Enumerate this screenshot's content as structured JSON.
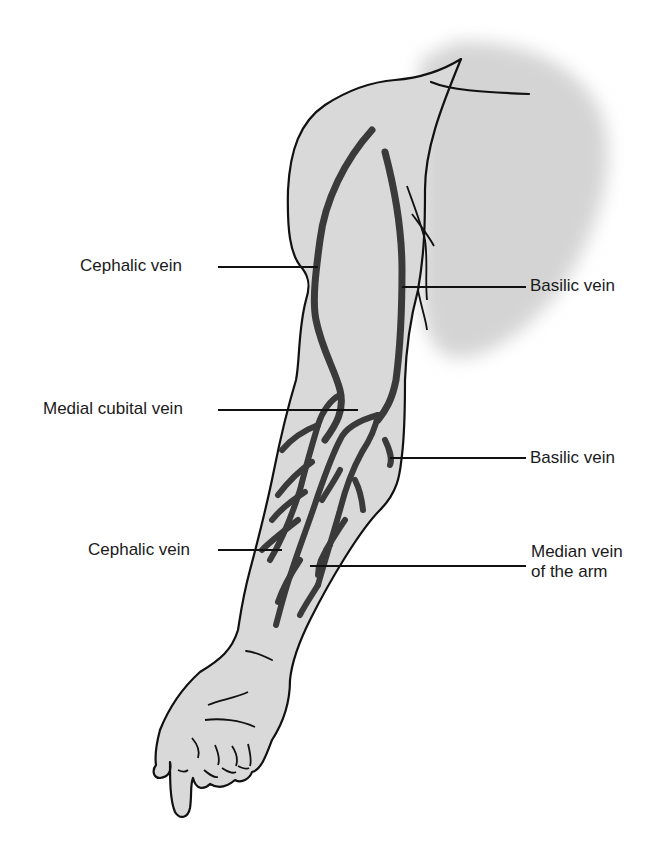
{
  "figure": {
    "colors": {
      "skin_fill": "#d9d9d9",
      "torso_shade": "#d4d4d4",
      "outline": "#111111",
      "vein": "#3a3a3a",
      "leader_line": "#111111",
      "label_text": "#1a1a1a",
      "background": "#ffffff"
    }
  },
  "labels": [
    {
      "id": "cephalic-upper",
      "text": "Cephalic vein",
      "side": "left",
      "x": 80,
      "y": 256
    },
    {
      "id": "basilic-upper",
      "text": "Basilic vein",
      "side": "right",
      "x": 530,
      "y": 276
    },
    {
      "id": "medial-cubital",
      "text": "Medial cubital vein",
      "side": "left",
      "x": 43,
      "y": 399
    },
    {
      "id": "basilic-lower",
      "text": "Basilic vein",
      "side": "right",
      "x": 530,
      "y": 448
    },
    {
      "id": "cephalic-lower",
      "text": "Cephalic vein",
      "side": "left",
      "x": 88,
      "y": 540
    },
    {
      "id": "median-arm-line1",
      "text": "Median vein",
      "side": "right",
      "x": 531,
      "y": 542
    },
    {
      "id": "median-arm-line2",
      "text": "of the arm",
      "side": "right",
      "x": 531,
      "y": 562
    }
  ]
}
